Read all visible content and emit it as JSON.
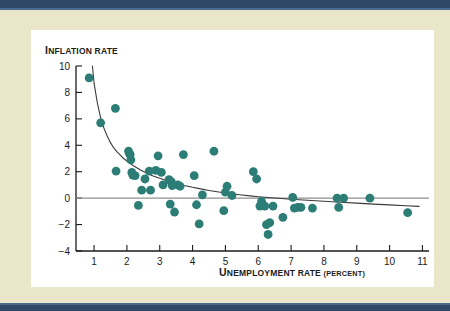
{
  "page": {
    "background_color": "#e9e6ca",
    "card_color": "#ffffff",
    "bar_color": "#2e4866",
    "bar_highlight_color": "#4a6a90"
  },
  "labels": {
    "y_axis_title_first": "I",
    "y_axis_title_rest": "NFLATION RATE",
    "x_axis_title_first": "U",
    "x_axis_title_mid": "NEMPLOYMENT RATE ",
    "x_axis_title_paren": "(PERCENT)"
  },
  "chart_data": {
    "type": "scatter",
    "title": "",
    "xlabel": "Unemployment rate (percent)",
    "ylabel": "Inflation rate",
    "xlim": [
      0.45,
      11.2
    ],
    "ylim": [
      -4,
      10
    ],
    "xticks": [
      1,
      2,
      3,
      4,
      5,
      6,
      7,
      8,
      9,
      10,
      11
    ],
    "xtick_labels": [
      "1",
      "2",
      "3",
      "4",
      "5",
      "6",
      "7",
      "8",
      "9",
      "10",
      "11"
    ],
    "yticks": [
      -4,
      -2,
      0,
      2,
      4,
      6,
      8,
      10
    ],
    "ytick_labels": [
      "−4",
      "−2",
      "0",
      "2",
      "4",
      "6",
      "8",
      "10"
    ],
    "grid": false,
    "legend": "none",
    "marker_color": "#2d7d77",
    "marker_size": 4.4,
    "zero_line": {
      "y": 0,
      "color": "#8f8f8f",
      "width": 1.4
    },
    "fit_curve": {
      "label": "fitted Phillips curve",
      "color": "#3a3a3a",
      "width": 1.1,
      "points": [
        [
          0.95,
          10.0
        ],
        [
          1.0,
          8.7
        ],
        [
          1.1,
          7.2
        ],
        [
          1.2,
          6.1
        ],
        [
          1.3,
          5.3
        ],
        [
          1.4,
          4.7
        ],
        [
          1.5,
          4.2
        ],
        [
          1.6,
          3.8
        ],
        [
          1.7,
          3.5
        ],
        [
          1.8,
          3.25
        ],
        [
          1.9,
          3.0
        ],
        [
          2.0,
          2.8
        ],
        [
          2.2,
          2.45
        ],
        [
          2.4,
          2.15
        ],
        [
          2.6,
          1.9
        ],
        [
          2.8,
          1.68
        ],
        [
          3.0,
          1.5
        ],
        [
          3.25,
          1.3
        ],
        [
          3.5,
          1.12
        ],
        [
          3.75,
          0.96
        ],
        [
          4.0,
          0.82
        ],
        [
          4.25,
          0.7
        ],
        [
          4.5,
          0.58
        ],
        [
          4.75,
          0.48
        ],
        [
          5.0,
          0.39
        ],
        [
          5.25,
          0.31
        ],
        [
          5.5,
          0.24
        ],
        [
          5.75,
          0.17
        ],
        [
          6.0,
          0.11
        ],
        [
          6.5,
          0.01
        ],
        [
          7.0,
          -0.08
        ],
        [
          7.5,
          -0.16
        ],
        [
          8.0,
          -0.24
        ],
        [
          8.5,
          -0.31
        ],
        [
          9.0,
          -0.38
        ],
        [
          9.5,
          -0.45
        ],
        [
          10.0,
          -0.51
        ],
        [
          10.5,
          -0.57
        ],
        [
          10.9,
          -0.62
        ]
      ]
    },
    "x": [
      0.85,
      1.2,
      1.65,
      1.67,
      2.05,
      2.08,
      2.1,
      2.12,
      2.15,
      2.18,
      2.25,
      2.35,
      2.45,
      2.55,
      2.68,
      2.72,
      2.88,
      2.95,
      3.05,
      3.1,
      3.28,
      3.32,
      3.35,
      3.38,
      3.45,
      3.55,
      3.62,
      3.72,
      4.05,
      4.12,
      4.2,
      4.3,
      4.65,
      4.95,
      5.0,
      5.05,
      5.2,
      5.85,
      5.95,
      6.05,
      6.1,
      6.2,
      6.25,
      6.3,
      6.35,
      6.45,
      6.75,
      7.05,
      7.1,
      7.2,
      7.3,
      7.65,
      8.4,
      8.45,
      8.6,
      9.4,
      10.55
    ],
    "y": [
      9.1,
      5.7,
      6.8,
      2.05,
      3.55,
      3.35,
      3.3,
      2.9,
      1.95,
      1.75,
      1.7,
      -0.55,
      0.6,
      1.45,
      2.05,
      0.6,
      2.1,
      3.2,
      1.95,
      1.0,
      1.4,
      -0.45,
      1.25,
      0.95,
      -1.05,
      1.0,
      0.9,
      3.3,
      1.7,
      -0.5,
      -1.95,
      0.25,
      3.55,
      -0.95,
      0.45,
      0.9,
      0.2,
      2.0,
      1.45,
      -0.6,
      -0.25,
      -0.6,
      -2.0,
      -2.75,
      -1.85,
      -0.6,
      -1.45,
      0.05,
      -0.75,
      -0.7,
      -0.7,
      -0.75,
      0.0,
      -0.7,
      0.0,
      0.0,
      -1.1
    ]
  }
}
